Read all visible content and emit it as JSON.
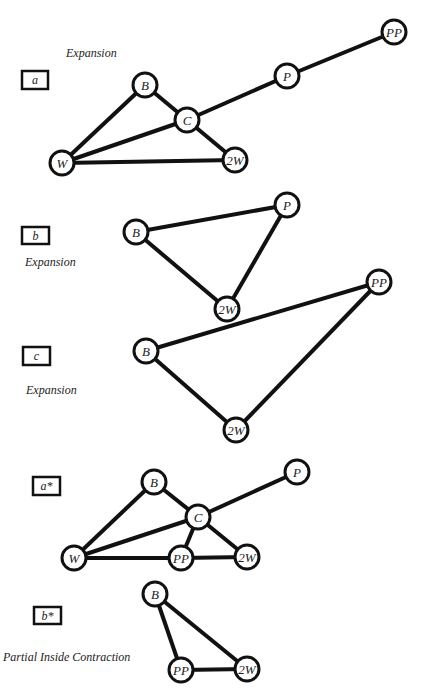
{
  "colors": {
    "line": "#111111",
    "background": "#ffffff",
    "text": "#222222"
  },
  "node_radius": 12,
  "panels": [
    {
      "id": "a",
      "label": "a",
      "box": {
        "x": 22,
        "y": 71,
        "w": 26,
        "h": 18
      },
      "caption": {
        "text": "Expansion",
        "x": 66,
        "y": 57
      },
      "nodes": [
        {
          "id": "B",
          "label": "B",
          "x": 145,
          "y": 85
        },
        {
          "id": "C",
          "label": "C",
          "x": 187,
          "y": 120
        },
        {
          "id": "P",
          "label": "P",
          "x": 287,
          "y": 76
        },
        {
          "id": "PP",
          "label": "PP",
          "x": 394,
          "y": 32
        },
        {
          "id": "W",
          "label": "W",
          "x": 62,
          "y": 163
        },
        {
          "id": "2W",
          "label": "2W",
          "x": 235,
          "y": 160
        }
      ],
      "edges": [
        [
          "W",
          "B"
        ],
        [
          "B",
          "C"
        ],
        [
          "W",
          "C"
        ],
        [
          "C",
          "P"
        ],
        [
          "P",
          "PP"
        ],
        [
          "C",
          "2W"
        ],
        [
          "W",
          "2W"
        ]
      ]
    },
    {
      "id": "b",
      "label": "b",
      "box": {
        "x": 22,
        "y": 227,
        "w": 27,
        "h": 17
      },
      "caption": {
        "text": "Expansion",
        "x": 25,
        "y": 266
      },
      "nodes": [
        {
          "id": "B",
          "label": "B",
          "x": 136,
          "y": 232
        },
        {
          "id": "P",
          "label": "P",
          "x": 287,
          "y": 205
        },
        {
          "id": "2W",
          "label": "2W",
          "x": 227,
          "y": 309
        }
      ],
      "edges": [
        [
          "B",
          "P"
        ],
        [
          "B",
          "2W"
        ],
        [
          "P",
          "2W"
        ]
      ]
    },
    {
      "id": "c",
      "label": "c",
      "box": {
        "x": 23,
        "y": 347,
        "w": 27,
        "h": 18
      },
      "caption": {
        "text": "Expansion",
        "x": 26,
        "y": 394
      },
      "nodes": [
        {
          "id": "B",
          "label": "B",
          "x": 146,
          "y": 351
        },
        {
          "id": "PP",
          "label": "PP",
          "x": 379,
          "y": 282
        },
        {
          "id": "2W",
          "label": "2W",
          "x": 236,
          "y": 430
        }
      ],
      "edges": [
        [
          "B",
          "PP"
        ],
        [
          "B",
          "2W"
        ],
        [
          "PP",
          "2W"
        ]
      ]
    },
    {
      "id": "a-star",
      "label": "a*",
      "box": {
        "x": 33,
        "y": 477,
        "w": 27,
        "h": 18
      },
      "caption": null,
      "nodes": [
        {
          "id": "B",
          "label": "B",
          "x": 154,
          "y": 482
        },
        {
          "id": "C",
          "label": "C",
          "x": 198,
          "y": 517
        },
        {
          "id": "P",
          "label": "P",
          "x": 297,
          "y": 472
        },
        {
          "id": "W",
          "label": "W",
          "x": 74,
          "y": 558
        },
        {
          "id": "PP",
          "label": "PP",
          "x": 181,
          "y": 558
        },
        {
          "id": "2W",
          "label": "2W",
          "x": 247,
          "y": 557
        }
      ],
      "edges": [
        [
          "W",
          "B"
        ],
        [
          "B",
          "C"
        ],
        [
          "W",
          "C"
        ],
        [
          "C",
          "P"
        ],
        [
          "C",
          "PP"
        ],
        [
          "C",
          "2W"
        ],
        [
          "W",
          "PP"
        ],
        [
          "PP",
          "2W"
        ]
      ]
    },
    {
      "id": "b-star",
      "label": "b*",
      "box": {
        "x": 34,
        "y": 607,
        "w": 27,
        "h": 17
      },
      "caption": {
        "text": "Partial Inside Contraction",
        "x": 3,
        "y": 661
      },
      "nodes": [
        {
          "id": "B",
          "label": "B",
          "x": 155,
          "y": 594
        },
        {
          "id": "PP",
          "label": "PP",
          "x": 181,
          "y": 670
        },
        {
          "id": "2W",
          "label": "2W",
          "x": 247,
          "y": 669
        }
      ],
      "edges": [
        [
          "B",
          "PP"
        ],
        [
          "B",
          "2W"
        ],
        [
          "PP",
          "2W"
        ]
      ]
    }
  ]
}
